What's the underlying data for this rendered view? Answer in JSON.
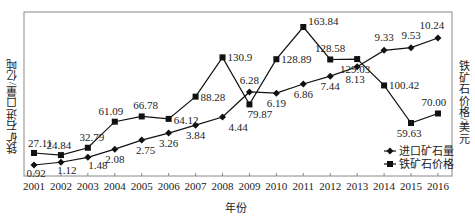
{
  "chart_data": {
    "type": "line",
    "title": "",
    "xlabel": "年份",
    "ylabel_left": "铁矿石进口量/亿吨",
    "ylabel_right": "铁矿石价格/美元",
    "categories": [
      "2001",
      "2002",
      "2003",
      "2004",
      "2005",
      "2006",
      "2007",
      "2008",
      "2009",
      "2010",
      "2011",
      "2012",
      "2013",
      "2014",
      "2015",
      "2016"
    ],
    "series": [
      {
        "name": "进口矿石量",
        "axis": "left",
        "marker": "diamond",
        "values": [
          0.92,
          1.12,
          1.48,
          2.08,
          2.75,
          3.26,
          3.84,
          4.44,
          6.28,
          6.19,
          6.86,
          7.44,
          8.13,
          9.33,
          9.53,
          10.24
        ],
        "labels": [
          "0.92",
          "1.12",
          "1.48",
          "2.08",
          "2.75",
          "3.26",
          "3.84",
          "4.44",
          "6.28",
          "6.19",
          "6.86",
          "7.44",
          "8.13",
          "9.33",
          "9.53",
          "10.24"
        ]
      },
      {
        "name": "铁矿石价格",
        "axis": "right",
        "marker": "square",
        "values": [
          27.11,
          24.84,
          32.79,
          61.09,
          66.78,
          64.12,
          88.28,
          130.9,
          79.87,
          128.89,
          163.84,
          128.58,
          129.03,
          100.42,
          59.63,
          70.0
        ],
        "labels": [
          "27.11",
          "24.84",
          "32.79",
          "61.09",
          "66.78",
          "64.12",
          "88.28",
          "130.9",
          "79.87",
          "128.89",
          "163.84",
          "128.58",
          "129.03",
          "100.42",
          "59.63",
          "70.00"
        ]
      }
    ],
    "legend": {
      "position": "lower-right-inside",
      "entries": [
        "进口矿石量",
        "铁矿石价格"
      ]
    },
    "grid": false,
    "colors": {
      "line": "#111111",
      "axis": "#888888",
      "text": "#222222"
    }
  }
}
